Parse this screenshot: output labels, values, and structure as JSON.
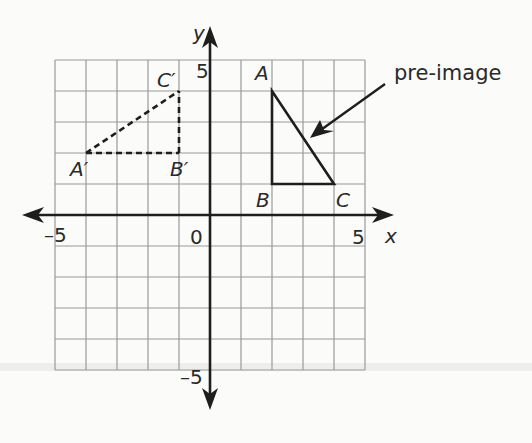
{
  "figure": {
    "type": "coordinate-plane-transformation",
    "axes": {
      "x_label": "x",
      "y_label": "y",
      "x_min_label": "–5",
      "x_max_label": "5",
      "y_max_label": "5",
      "y_min_label": "–5",
      "origin_label": "0",
      "range": [
        -5,
        5
      ]
    },
    "pre_image": {
      "callout": "pre-image",
      "vertices": [
        {
          "label": "A",
          "x": 2,
          "y": 4
        },
        {
          "label": "B",
          "x": 2,
          "y": 1
        },
        {
          "label": "C",
          "x": 4,
          "y": 1
        }
      ],
      "style": "solid"
    },
    "image": {
      "vertices": [
        {
          "label": "A′",
          "x": -4,
          "y": 2
        },
        {
          "label": "B′",
          "x": -1,
          "y": 2
        },
        {
          "label": "C′",
          "x": -1,
          "y": 4
        }
      ],
      "style": "dashed"
    },
    "colors": {
      "grid": "#9a9a9a",
      "axis": "#1e1e1e",
      "figure": "#1e1e1e",
      "background": "#fbfbf9"
    }
  }
}
